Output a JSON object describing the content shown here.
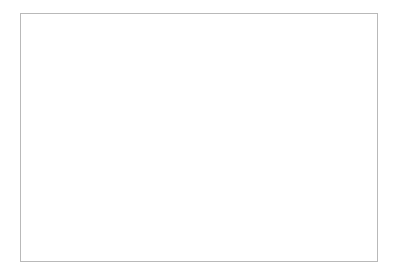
{
  "chart_data": {
    "type": "line",
    "title": "",
    "xlabel": "",
    "ylabel": "Orders/Hour",
    "categories": [
      "January",
      "February",
      "March",
      "April",
      "May",
      "June",
      "July",
      "August",
      "September",
      "October",
      "November",
      "December"
    ],
    "values": [
      350,
      350,
      375,
      450,
      500,
      575,
      700,
      900,
      1100,
      1150,
      1225,
      1380
    ],
    "series": [
      {
        "name": "Orders/Hour",
        "values": [
          350,
          350,
          375,
          450,
          500,
          575,
          700,
          900,
          1100,
          1150,
          1225,
          1380
        ]
      }
    ],
    "ylim": [
      0,
      1600
    ],
    "yticks": [
      0,
      200,
      400,
      600,
      800,
      1000,
      1200,
      1400,
      1600
    ],
    "ytick_labels": [
      "0",
      "200",
      "400",
      "600",
      "800",
      "1000",
      "1200",
      "1400",
      "1600"
    ],
    "grid": "both",
    "legend": "none",
    "marker": "square",
    "line_color": "#2b2b2b",
    "marker_color": "#1c1c1c",
    "grid_color": "#a8a8a8",
    "axis_color": "#6e6e6e",
    "xtick_label_rotation": -45,
    "background": "#ffffff"
  }
}
